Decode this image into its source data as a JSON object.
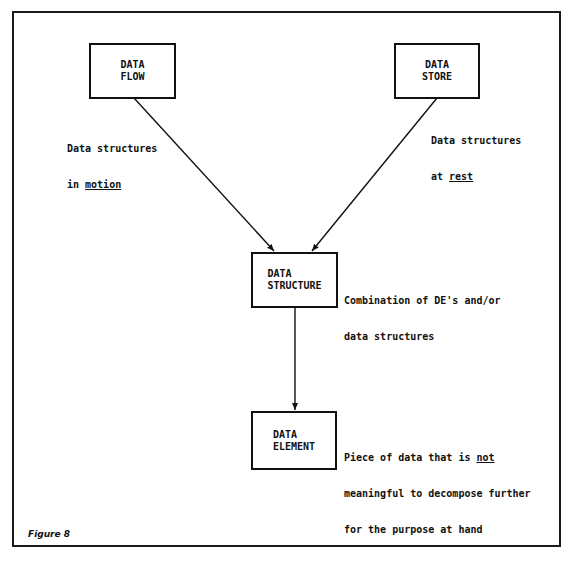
{
  "figure": {
    "caption": "Figure 8"
  },
  "nodes": {
    "data_flow": {
      "line1": "DATA",
      "line2": "FLOW",
      "note": {
        "line1": "Data structures",
        "line2_prefix": "in ",
        "line2_emphasis": "motion"
      }
    },
    "data_store": {
      "line1": "DATA",
      "line2": "STORE",
      "note": {
        "line1": "Data structures",
        "line2_prefix": "at ",
        "line2_emphasis": "rest"
      }
    },
    "data_structure": {
      "line1": "DATA",
      "line2": "STRUCTURE",
      "note": {
        "line1": "Combination of DE's and/or",
        "line2": "data structures"
      }
    },
    "data_element": {
      "line1": "DATA",
      "line2": "ELEMENT",
      "note": {
        "line1_prefix": "Piece of data that is ",
        "line1_emphasis": "not",
        "line2": "meaningful to decompose further",
        "line3": "for the purpose at hand"
      }
    }
  },
  "edges": [
    {
      "from": "data_flow",
      "to": "data_structure"
    },
    {
      "from": "data_store",
      "to": "data_structure"
    },
    {
      "from": "data_structure",
      "to": "data_element"
    }
  ]
}
